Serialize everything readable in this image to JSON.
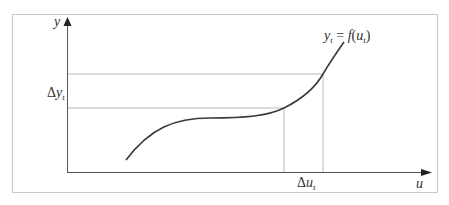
{
  "diagram": {
    "type": "function-increment-plot",
    "colors": {
      "frame": "#c8c8c8",
      "axis": "#555555",
      "guide": "#b9b9b9",
      "curve": "#3a3a3a",
      "text": "#333333"
    },
    "axes": {
      "y_label": "y",
      "x_label": "u"
    },
    "curve_label": {
      "lhs_var": "y",
      "lhs_sub": "t",
      "equals": " = ",
      "fn": "f",
      "open": "(",
      "arg_var": "u",
      "arg_sub": "t",
      "close": ")"
    },
    "delta_y_label": {
      "delta": "Δ",
      "var": "y",
      "sub": "t"
    },
    "delta_u_label": {
      "delta": "Δ",
      "var": "u",
      "sub": "t"
    }
  }
}
